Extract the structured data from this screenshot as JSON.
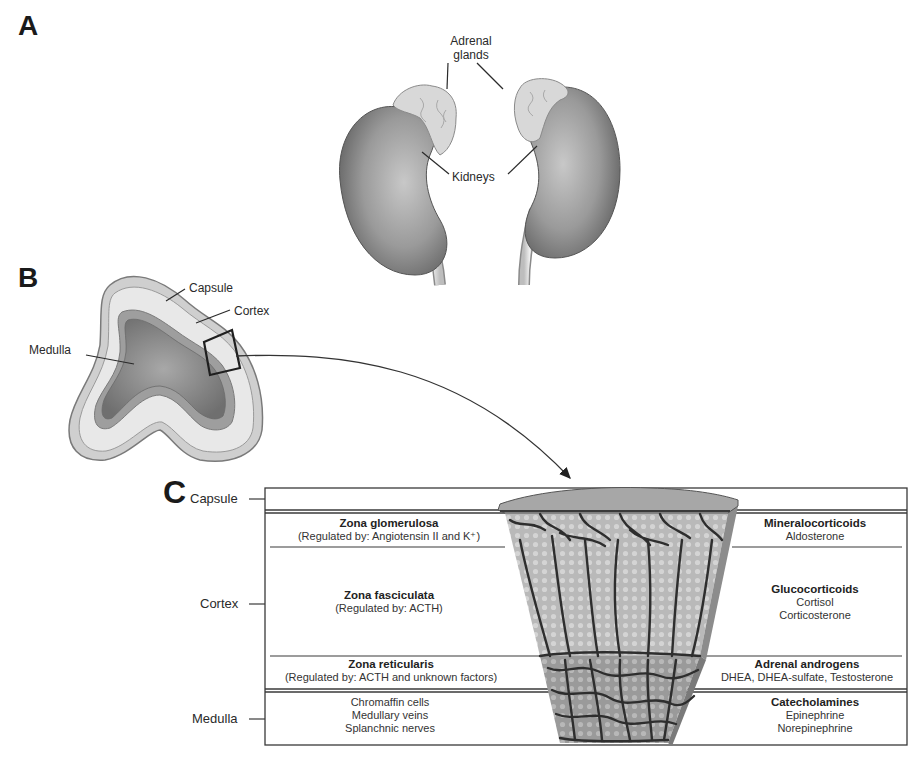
{
  "panels": {
    "A": {
      "letter": "A",
      "labels": {
        "adrenal_glands_line1": "Adrenal",
        "adrenal_glands_line2": "glands",
        "kidneys": "Kidneys"
      }
    },
    "B": {
      "letter": "B",
      "labels": {
        "capsule": "Capsule",
        "cortex": "Cortex",
        "medulla": "Medulla"
      }
    },
    "C": {
      "letter": "C",
      "side_labels": {
        "capsule": "Capsule",
        "cortex": "Cortex",
        "medulla": "Medulla"
      },
      "zones": [
        {
          "name": "Zona glomerulosa",
          "regulation": "(Regulated by: Angiotensin II and K⁺)",
          "product_class": "Mineralocorticoids",
          "products": [
            "Aldosterone"
          ]
        },
        {
          "name": "Zona fasciculata",
          "regulation": "(Regulated by: ACTH)",
          "product_class": "Glucocorticoids",
          "products": [
            "Cortisol",
            "Corticosterone"
          ]
        },
        {
          "name": "Zona reticularis",
          "regulation": "(Regulated by: ACTH and unknown factors)",
          "product_class": "Adrenal androgens",
          "products": [
            "DHEA, DHEA-sulfate, Testosterone"
          ]
        }
      ],
      "medulla": {
        "components": [
          "Chromaffin cells",
          "Medullary veins",
          "Splanchnic nerves"
        ],
        "product_class": "Catecholamines",
        "products": [
          "Epinephrine",
          "Norepinephrine"
        ]
      }
    }
  },
  "colors": {
    "line": "#3a3a3a",
    "kidney_dark": "#5a5a5a",
    "kidney_light": "#bdbdbd",
    "gland": "#d6d6d6",
    "cortex_light": "#e2e2e2",
    "medulla_dark": "#8a8a8a",
    "vessel": "#2e2e2e"
  }
}
